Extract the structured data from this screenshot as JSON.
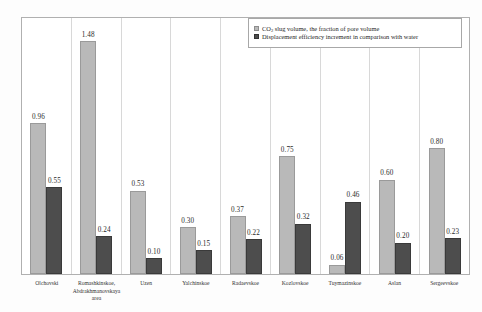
{
  "chart_data": {
    "type": "bar",
    "title": "",
    "subtitle": "",
    "xlabel": "",
    "ylabel": "",
    "ylim": [
      0,
      1.6
    ],
    "grid": "vertical-category-separators-only",
    "legend_position": "top-right",
    "categories": [
      "Olchovski",
      "Romashkinskoe, Abdrakhmanovskaya area",
      "Uzen",
      "Yalchinskoe",
      "Radaevskoe",
      "Kozlovskoe",
      "Tuymazinskoe",
      "Aslan",
      "Sergeevskoe"
    ],
    "series": [
      {
        "name": "CO2 slug volume, the fraction of pore volume",
        "color": "#b9b9b9",
        "values": [
          0.96,
          1.48,
          0.53,
          0.3,
          0.37,
          0.75,
          0.06,
          0.6,
          0.8
        ],
        "labels": [
          "0.96",
          "1.48",
          "0.53",
          "0.30",
          "0.37",
          "0.75",
          "0.06",
          "0.60",
          "0.80"
        ]
      },
      {
        "name": "Displacement efficiency increment in comparison with water",
        "color": "#4d4d4d",
        "values": [
          0.55,
          0.24,
          0.1,
          0.15,
          0.22,
          0.32,
          0.46,
          0.2,
          0.23
        ],
        "labels": [
          "0.55",
          "0.24",
          "0.10",
          "0.15",
          "0.22",
          "0.32",
          "0.46",
          "0.20",
          "0.23"
        ]
      }
    ]
  },
  "legend": {
    "items": [
      {
        "marker": "light-square-marker",
        "label_pre": "CO",
        "label_sub": "2",
        "label_post": " slug volume, the fraction of pore volume"
      },
      {
        "marker": "dark-square-marker",
        "label_pre": "Displacement efficiency increment in comparison with water",
        "label_sub": "",
        "label_post": ""
      }
    ]
  }
}
